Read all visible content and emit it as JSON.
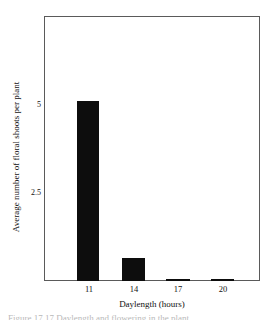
{
  "figure": {
    "background_color": "#ffffff",
    "frame_color": "#5a5a5a",
    "bar_color": "#0d0d0d",
    "caption_fragment": "Figure 17.17  Daylength and flowering in the plant"
  },
  "chart_data": {
    "type": "bar",
    "title": "",
    "subtitle": "",
    "xlabel": "Daylength (hours)",
    "ylabel": "Average number of floral shoots per plant",
    "categories": [
      "11",
      "14",
      "17",
      "20"
    ],
    "values": [
      5.1,
      0.65,
      0.07,
      0.05
    ],
    "series": [
      {
        "name": "Average number of floral shoots per plant",
        "values": [
          5.1,
          0.65,
          0.07,
          0.05
        ]
      }
    ],
    "ylim": [
      0,
      7.5
    ],
    "xlim": [
      9.5,
      21.5
    ],
    "yticks": [
      2.5,
      5
    ],
    "ytick_labels": [
      "2.5",
      "5"
    ],
    "xtick_labels": [
      "11",
      "14",
      "17",
      "20"
    ],
    "grid": false,
    "legend": null,
    "legend_position": "none",
    "annotations": []
  }
}
